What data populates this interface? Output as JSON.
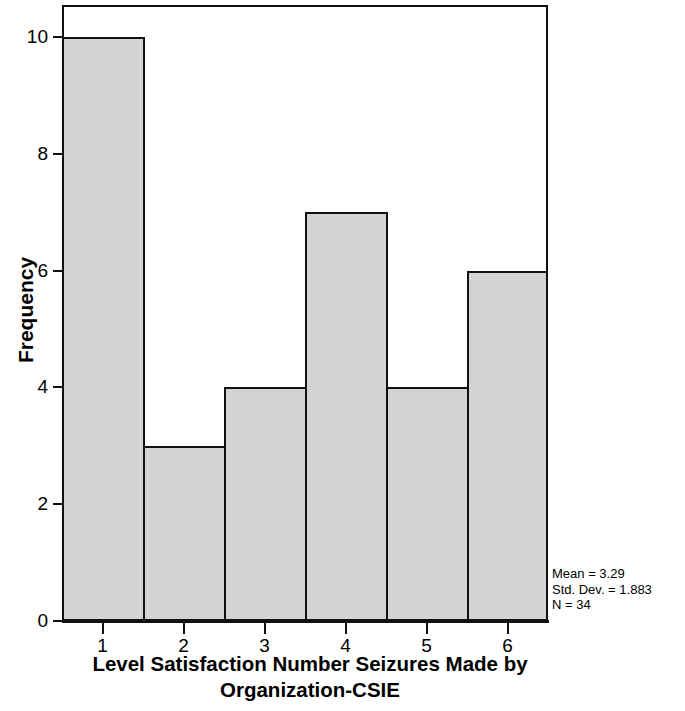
{
  "chart_data": {
    "type": "bar",
    "chart_subtype": "histogram",
    "title": "",
    "xlabel": "Level Satisfaction Number Seizures Made by Organization-CSIE",
    "xlabel_lines": [
      "Level Satisfaction Number Seizures Made by",
      "Organization-CSIE"
    ],
    "ylabel": "Frequency",
    "categories": [
      "1",
      "2",
      "3",
      "4",
      "5",
      "6"
    ],
    "values": [
      10,
      3,
      4,
      7,
      4,
      6
    ],
    "x_tick_labels": [
      "1",
      "2",
      "3",
      "4",
      "5",
      "6"
    ],
    "y_tick_labels": [
      "0",
      "2",
      "4",
      "6",
      "8",
      "10"
    ],
    "y_ticks": [
      0,
      2,
      4,
      6,
      8,
      10
    ],
    "ylim": [
      0,
      10.55
    ],
    "xlim": [
      0.5,
      6.5
    ],
    "grid": false,
    "legend": false,
    "bar_fill_color": "#d3d3d3",
    "bar_edge_color": "#111111",
    "background_color": "#ffffff",
    "annotations": {
      "mean": "Mean = 3.29",
      "std_dev": "Std. Dev. = 1.883",
      "n": "N = 34"
    },
    "statistics": {
      "mean_value": 3.29,
      "std_dev_value": 1.883,
      "n_value": 34
    }
  }
}
